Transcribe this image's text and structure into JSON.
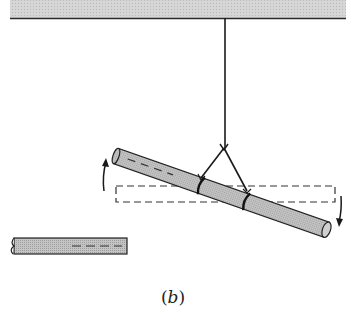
{
  "figure": {
    "caption": "(b)",
    "caption_letter": "b"
  },
  "colors": {
    "ceiling_fill": "#d4d4d4",
    "line": "#1a1a1a",
    "rod_fill": "#bdbdbd",
    "background": "#ffffff"
  },
  "elements": {
    "ceiling": {
      "x1": 10,
      "x2": 346,
      "y_top": 0,
      "y_bottom": 18
    },
    "rope": {
      "x": 225,
      "y1": 18,
      "y2": 148
    },
    "sling": {
      "apex": [
        224,
        148
      ],
      "left_end": [
        201,
        177
      ],
      "right_end": [
        247,
        190
      ]
    },
    "tilted_rod": {
      "start": [
        116,
        156
      ],
      "end": [
        327,
        230
      ],
      "thickness": 16
    },
    "dashed_outline": {
      "x": 116,
      "y": 186,
      "width": 219,
      "height": 16
    },
    "arrows": [
      {
        "name": "counter-rotation-up",
        "x": 104,
        "y_from": 188,
        "y_to": 158,
        "direction": "up"
      },
      {
        "name": "rotation-down",
        "x": 340,
        "y_from": 196,
        "y_to": 226,
        "direction": "down"
      }
    ],
    "small_rod": {
      "x": 12,
      "y": 238,
      "width": 115,
      "height": 16
    }
  }
}
